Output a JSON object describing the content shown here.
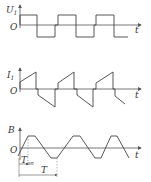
{
  "colors": {
    "line": "#444444",
    "axis": "#555555",
    "dash": "#888888",
    "text": "#333333"
  },
  "panels": [
    {
      "name": "voltage-panel",
      "y_label": "U",
      "y_sub": "1",
      "origin": "O",
      "x_label": "t",
      "waveform": "square"
    },
    {
      "name": "current-panel",
      "y_label": "I",
      "y_sub": "1",
      "origin": "O",
      "x_label": "t",
      "waveform": "sawtooth-bipolar"
    },
    {
      "name": "flux-panel",
      "y_label": "B",
      "origin": "O",
      "x_label": "t",
      "waveform": "trapezoidal",
      "annotations": {
        "t_on": "T",
        "t_on_sub": "on",
        "period": "T"
      }
    }
  ]
}
